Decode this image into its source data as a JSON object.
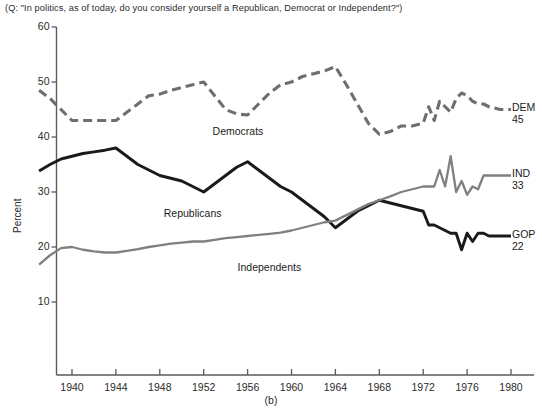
{
  "figure": {
    "question_title": "(Q: \"In politics, as of today, do you consider yourself a Republican, Democrat or Independent?\")",
    "caption": "(b)",
    "ylabel": "Percent"
  },
  "colors": {
    "dem": "#6e6e6e",
    "gop": "#1a1a1a",
    "ind": "#808080",
    "axis": "#5a5a5a",
    "text": "#2b2b2b",
    "background": "#ffffff"
  },
  "inline_labels": {
    "democrats": "Democrats",
    "republicans": "Republicans",
    "independents": "Independents"
  },
  "end_labels": {
    "dem_name": "DEM",
    "dem_value": "45",
    "ind_name": "IND",
    "ind_value": "33",
    "gop_name": "GOP",
    "gop_value": "22"
  },
  "chart_data": {
    "type": "line",
    "title": "(Q: \"In politics, as of today, do you consider yourself a Republican, Democrat or Independent?\")",
    "subtitle": "(b)",
    "xlabel": "",
    "ylabel": "Percent",
    "xlim": [
      1937,
      1981
    ],
    "ylim": [
      0,
      60
    ],
    "yticks": [
      10,
      20,
      30,
      40,
      50,
      60
    ],
    "xticks": [
      1940,
      1944,
      1948,
      1952,
      1956,
      1960,
      1964,
      1968,
      1972,
      1976,
      1980
    ],
    "grid": false,
    "legend": "inline-and-right-edge",
    "series": [
      {
        "name": "Democrats",
        "short": "DEM",
        "style": "dashed",
        "color": "#6e6e6e",
        "final_value": 45,
        "points": [
          [
            1937,
            48.5
          ],
          [
            1938,
            47.0
          ],
          [
            1939,
            45.0
          ],
          [
            1940,
            43.0
          ],
          [
            1941,
            43.0
          ],
          [
            1942,
            43.0
          ],
          [
            1943,
            43.0
          ],
          [
            1944,
            43.0
          ],
          [
            1945,
            44.5
          ],
          [
            1946,
            46.0
          ],
          [
            1947,
            47.5
          ],
          [
            1948,
            47.8
          ],
          [
            1949,
            48.5
          ],
          [
            1950,
            49.0
          ],
          [
            1951,
            49.5
          ],
          [
            1952,
            50.0
          ],
          [
            1953,
            47.5
          ],
          [
            1954,
            45.0
          ],
          [
            1955,
            44.2
          ],
          [
            1956,
            44.0
          ],
          [
            1957,
            46.0
          ],
          [
            1958,
            48.0
          ],
          [
            1959,
            49.5
          ],
          [
            1960,
            50.0
          ],
          [
            1961,
            51.0
          ],
          [
            1962,
            51.5
          ],
          [
            1963,
            52.0
          ],
          [
            1964,
            52.8
          ],
          [
            1965,
            49.5
          ],
          [
            1966,
            46.0
          ],
          [
            1967,
            42.5
          ],
          [
            1968,
            40.5
          ],
          [
            1969,
            41.0
          ],
          [
            1970,
            42.0
          ],
          [
            1971,
            42.0
          ],
          [
            1972,
            42.5
          ],
          [
            1972.5,
            45.5
          ],
          [
            1973,
            43.0
          ],
          [
            1973.5,
            46.5
          ],
          [
            1974,
            45.5
          ],
          [
            1974.5,
            44.5
          ],
          [
            1975,
            47.0
          ],
          [
            1975.5,
            48.0
          ],
          [
            1976,
            47.5
          ],
          [
            1976.5,
            46.5
          ],
          [
            1977,
            46.0
          ],
          [
            1977.5,
            46.0
          ],
          [
            1978,
            45.5
          ],
          [
            1979,
            45.0
          ],
          [
            1980,
            45.0
          ]
        ]
      },
      {
        "name": "Republicans",
        "short": "GOP",
        "style": "solid-thick",
        "color": "#1a1a1a",
        "final_value": 22,
        "points": [
          [
            1937,
            33.8
          ],
          [
            1938,
            35.0
          ],
          [
            1939,
            36.0
          ],
          [
            1940,
            36.5
          ],
          [
            1941,
            37.0
          ],
          [
            1942,
            37.3
          ],
          [
            1943,
            37.6
          ],
          [
            1944,
            38.0
          ],
          [
            1945,
            36.5
          ],
          [
            1946,
            35.0
          ],
          [
            1947,
            34.0
          ],
          [
            1948,
            33.0
          ],
          [
            1949,
            32.5
          ],
          [
            1950,
            32.0
          ],
          [
            1951,
            31.0
          ],
          [
            1952,
            30.0
          ],
          [
            1953,
            31.5
          ],
          [
            1954,
            33.0
          ],
          [
            1955,
            34.5
          ],
          [
            1956,
            35.5
          ],
          [
            1957,
            34.0
          ],
          [
            1958,
            32.5
          ],
          [
            1959,
            31.0
          ],
          [
            1960,
            30.0
          ],
          [
            1961,
            28.5
          ],
          [
            1962,
            27.0
          ],
          [
            1963,
            25.5
          ],
          [
            1964,
            23.5
          ],
          [
            1965,
            25.0
          ],
          [
            1966,
            26.5
          ],
          [
            1967,
            27.5
          ],
          [
            1968,
            28.5
          ],
          [
            1969,
            28.0
          ],
          [
            1970,
            27.5
          ],
          [
            1971,
            27.0
          ],
          [
            1972,
            26.5
          ],
          [
            1972.5,
            24.0
          ],
          [
            1973,
            24.0
          ],
          [
            1973.5,
            23.5
          ],
          [
            1974,
            23.0
          ],
          [
            1974.5,
            22.5
          ],
          [
            1975,
            22.5
          ],
          [
            1975.5,
            19.5
          ],
          [
            1976,
            22.5
          ],
          [
            1976.5,
            21.0
          ],
          [
            1977,
            22.5
          ],
          [
            1977.5,
            22.5
          ],
          [
            1978,
            22.0
          ],
          [
            1979,
            22.0
          ],
          [
            1980,
            22.0
          ]
        ]
      },
      {
        "name": "Independents",
        "short": "IND",
        "style": "solid-medium",
        "color": "#808080",
        "final_value": 33,
        "points": [
          [
            1937,
            16.8
          ],
          [
            1938,
            18.5
          ],
          [
            1939,
            19.8
          ],
          [
            1940,
            20.0
          ],
          [
            1941,
            19.5
          ],
          [
            1942,
            19.2
          ],
          [
            1943,
            19.0
          ],
          [
            1944,
            19.0
          ],
          [
            1945,
            19.3
          ],
          [
            1946,
            19.6
          ],
          [
            1947,
            20.0
          ],
          [
            1948,
            20.3
          ],
          [
            1949,
            20.6
          ],
          [
            1950,
            20.8
          ],
          [
            1951,
            21.0
          ],
          [
            1952,
            21.0
          ],
          [
            1953,
            21.3
          ],
          [
            1954,
            21.6
          ],
          [
            1955,
            21.8
          ],
          [
            1956,
            22.0
          ],
          [
            1957,
            22.2
          ],
          [
            1958,
            22.4
          ],
          [
            1959,
            22.6
          ],
          [
            1960,
            23.0
          ],
          [
            1961,
            23.5
          ],
          [
            1962,
            24.0
          ],
          [
            1963,
            24.5
          ],
          [
            1964,
            24.8
          ],
          [
            1965,
            25.8
          ],
          [
            1966,
            26.8
          ],
          [
            1967,
            27.8
          ],
          [
            1968,
            28.5
          ],
          [
            1969,
            29.2
          ],
          [
            1970,
            30.0
          ],
          [
            1971,
            30.5
          ],
          [
            1972,
            31.0
          ],
          [
            1972.5,
            31.0
          ],
          [
            1973,
            31.0
          ],
          [
            1973.5,
            34.0
          ],
          [
            1974,
            31.0
          ],
          [
            1974.5,
            36.5
          ],
          [
            1975,
            30.0
          ],
          [
            1975.5,
            32.0
          ],
          [
            1976,
            29.5
          ],
          [
            1976.5,
            31.0
          ],
          [
            1977,
            30.5
          ],
          [
            1977.5,
            33.0
          ],
          [
            1978,
            33.0
          ],
          [
            1979,
            33.0
          ],
          [
            1980,
            33.0
          ]
        ]
      }
    ]
  }
}
